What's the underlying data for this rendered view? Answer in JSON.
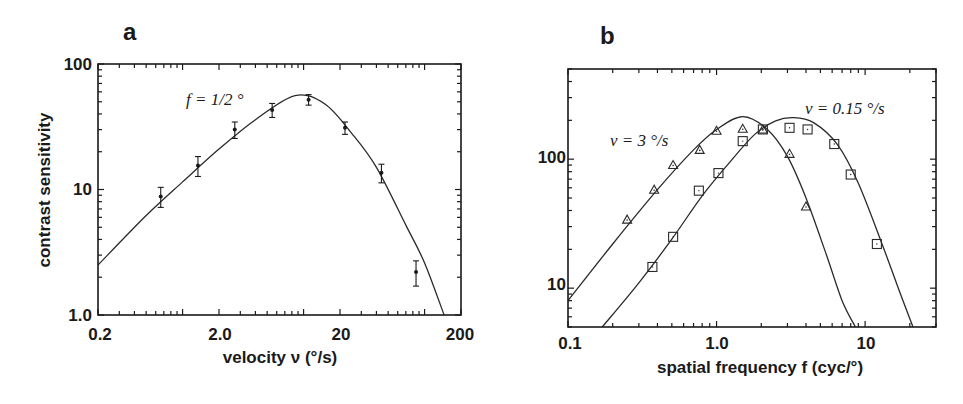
{
  "chart_data": [
    {
      "panel": "a",
      "type": "line",
      "title": "",
      "xlabel": "velocity ν (°/s)",
      "ylabel": "contrast sensitivity",
      "xscale": "log",
      "yscale": "log",
      "xlim": [
        0.2,
        200
      ],
      "ylim": [
        1.0,
        100
      ],
      "xticks": [
        "0.2",
        "2.0",
        "20",
        "200"
      ],
      "yticks": [
        "1.0",
        "10",
        "100"
      ],
      "grid": false,
      "legend": null,
      "annotations": [
        {
          "text": "f = 1/2 °",
          "x": 1.2,
          "y": 50
        }
      ],
      "series": [
        {
          "name": "f = 1/2° data",
          "marker": "dot-errorbar",
          "x": [
            0.66,
            1.34,
            2.7,
            5.5,
            11,
            22,
            44,
            85
          ],
          "y": [
            8.8,
            15.5,
            30,
            43,
            52,
            31,
            13.6,
            2.2
          ],
          "yerr": [
            1.6,
            2.8,
            4.5,
            5.5,
            5,
            3.5,
            2.3,
            0.5
          ]
        },
        {
          "name": "model fit",
          "marker": "none",
          "x": [
            0.2,
            0.5,
            1.0,
            2.0,
            4.0,
            8.5,
            15,
            25,
            40,
            70,
            100,
            145
          ],
          "y": [
            2.5,
            6.2,
            11.5,
            21,
            36,
            56,
            48,
            28,
            15,
            5.2,
            2.6,
            1.0
          ]
        }
      ]
    },
    {
      "panel": "b",
      "type": "scatter",
      "title": "",
      "xlabel": "spatial frequency f (cyc/°)",
      "ylabel": "",
      "xscale": "log",
      "yscale": "log",
      "xlim": [
        0.1,
        30
      ],
      "ylim": [
        5,
        500
      ],
      "xticks": [
        "0.1",
        "1.0",
        "10"
      ],
      "yticks": [
        "10",
        "100"
      ],
      "grid": false,
      "legend": null,
      "annotations": [
        {
          "text": "ν = 3 °/s",
          "x": 0.2,
          "y": 140
        },
        {
          "text": "ν = 0.15 °/s",
          "x": 4.0,
          "y": 240
        }
      ],
      "series": [
        {
          "name": "ν = 3 °/s",
          "marker": "triangle",
          "x": [
            0.25,
            0.38,
            0.51,
            0.77,
            1.0,
            1.5,
            2.05,
            3.1,
            4.0
          ],
          "y": [
            34,
            58,
            90,
            118,
            166,
            172,
            170,
            110,
            43
          ]
        },
        {
          "name": "ν = 0.15 °/s",
          "marker": "square",
          "x": [
            0.37,
            0.51,
            0.76,
            1.03,
            1.5,
            2.05,
            3.1,
            4.1,
            6.2,
            8.0,
            12
          ],
          "y": [
            14.6,
            25,
            57,
            78,
            138,
            170,
            175,
            170,
            131,
            76,
            22
          ]
        },
        {
          "name": "fit ν = 3 °/s",
          "marker": "none",
          "x": [
            0.1,
            0.2,
            0.4,
            0.7,
            1.0,
            1.5,
            2.2,
            3.0,
            4.0,
            5.5,
            7.0,
            8.6
          ],
          "y": [
            8,
            22,
            58,
            118,
            170,
            214,
            170,
            105,
            50,
            18,
            8,
            5
          ]
        },
        {
          "name": "fit ν = 0.15 °/s",
          "marker": "none",
          "x": [
            0.17,
            0.3,
            0.5,
            0.8,
            1.2,
            1.8,
            2.5,
            3.3,
            4.5,
            6.5,
            9.0,
            13,
            17,
            21
          ],
          "y": [
            5,
            11,
            24,
            52,
            92,
            155,
            198,
            210,
            192,
            130,
            65,
            22,
            9.5,
            5
          ]
        }
      ]
    }
  ],
  "panels": {
    "a": {
      "label": "a",
      "xlabel": "velocity ν  (°/s)",
      "ylabel": "contrast sensitivity",
      "annotation": "f = 1/2 °",
      "xticks": [
        "0.2",
        "2.0",
        "20",
        "200"
      ],
      "yticks": [
        "100",
        "10",
        "1.0"
      ]
    },
    "b": {
      "label": "b",
      "xlabel": "spatial frequency f  (cyc/°)",
      "annotation_fast": "ν = 3 °/s",
      "annotation_slow": "ν = 0.15 °/s",
      "xticks": [
        "0.1",
        "1.0",
        "10"
      ],
      "yticks": [
        "100",
        "10"
      ]
    }
  }
}
